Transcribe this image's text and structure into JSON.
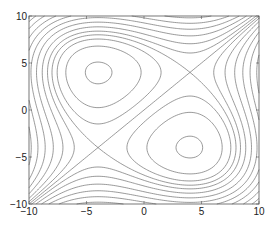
{
  "chart_data": {
    "type": "contour",
    "title": "",
    "xlabel": "",
    "ylabel": "",
    "xlim": [
      -10,
      10
    ],
    "ylim": [
      -10,
      10
    ],
    "xticks": [
      -10,
      -5,
      0,
      5,
      10
    ],
    "yticks": [
      -10,
      -5,
      0,
      5,
      10
    ],
    "xtick_labels": [
      "-10",
      "-5",
      "0",
      "5",
      "10"
    ],
    "ytick_labels": [
      "-10",
      "-5",
      "0",
      "5",
      "10"
    ],
    "grid": false,
    "legend": null,
    "function": "f(x,y) = (y^3 - 48*y) - (x^3 - 48*x)",
    "levels": [
      -1300,
      -1100,
      -900,
      -750,
      -600,
      -470,
      -350,
      -240,
      -140,
      -60,
      0,
      60,
      140,
      240,
      350,
      470,
      600,
      750,
      900,
      1100,
      1300
    ],
    "line_color": "#6e6e6e",
    "axes_color": "#555555"
  }
}
